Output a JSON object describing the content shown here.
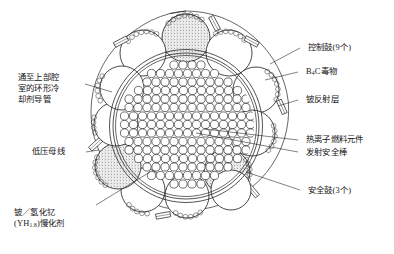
{
  "figure": {
    "type": "reactor-core-cross-section",
    "core": {
      "fuel_element_count_visible": 165,
      "fuel_element_rows": [
        4,
        8,
        10,
        12,
        14,
        14,
        16,
        16,
        16,
        16,
        14,
        14,
        12,
        10,
        8,
        4
      ],
      "outer_ring_label": "铍反射层"
    },
    "drums": {
      "total": 12,
      "control_count": 9,
      "safety_count": 3,
      "safety_positions": [
        "top",
        "lower-left",
        "lower-right"
      ],
      "poison_arc": "B4C"
    }
  },
  "labels": {
    "control_drum": "控制鼓(9个)",
    "poison": "B",
    "poison_sub": "4",
    "poison_tail": "C毒物",
    "reflector": "铍反射层",
    "fuel_element": "热离子燃料元件",
    "safety_rod": "发射安全棒",
    "safety_drum": "安全鼓(3个)",
    "coolant_duct_line1": "通至上部腔",
    "coolant_duct_line2": "室的环形冷",
    "coolant_duct_line3": "却剂导管",
    "bus_bar": "低压母线",
    "moderator_line1": "铍／氢化钇",
    "moderator_line2a": "(YH",
    "moderator_line2sub": "1.8",
    "moderator_line2b": ")慢化剂"
  },
  "colors": {
    "line": "#1a1a1a",
    "stipple": "#8e8e8e",
    "bead": "#444444",
    "background": "#ffffff"
  }
}
